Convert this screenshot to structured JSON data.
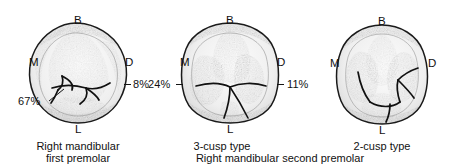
{
  "figure": {
    "background_color": "#ffffff",
    "ink_color": "#141414"
  },
  "teeth": [
    {
      "id": "right-mandibular-first-premolar",
      "orientation_labels": {
        "buccal": "B",
        "mesial": "M",
        "distal": "D",
        "lingual": "L"
      },
      "annotations": [
        {
          "name": "lingual-cusp-percent",
          "value": "67%"
        },
        {
          "name": "distal-percent",
          "value": "8%"
        }
      ],
      "caption_line1": "Right mandibular",
      "caption_line2": "first premolar"
    },
    {
      "id": "right-mandibular-second-premolar-3-cusp",
      "orientation_labels": {
        "buccal": "B",
        "mesial": "M",
        "distal": "D",
        "lingual": "L"
      },
      "annotations": [
        {
          "name": "mesiolingual-percent",
          "value": "24%"
        },
        {
          "name": "distolingual-percent",
          "value": "11%"
        }
      ],
      "caption_line1": "3-cusp type",
      "caption_line2": ""
    },
    {
      "id": "right-mandibular-second-premolar-2-cusp",
      "orientation_labels": {
        "buccal": "B",
        "mesial": "M",
        "distal": "D",
        "lingual": "L"
      },
      "annotations": [],
      "caption_line1": "2-cusp type",
      "caption_line2": ""
    }
  ],
  "shared_caption": "Right mandibular second premolar"
}
